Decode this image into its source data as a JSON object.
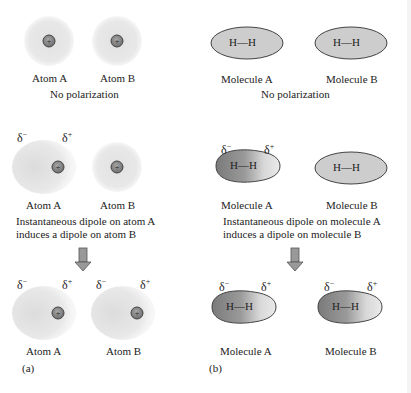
{
  "panel_a": {
    "label": "(a)",
    "row1": {
      "atom_a": "Atom A",
      "atom_b": "Atom B",
      "caption": "No polarization"
    },
    "row2": {
      "atom_a": "Atom A",
      "atom_b": "Atom B",
      "caption_line1": "Instantaneous dipole on atom A",
      "caption_line2": "induces a dipole on atom B",
      "delta_minus": "δ",
      "delta_plus": "δ",
      "minus": "−",
      "plus": "+"
    },
    "row3": {
      "atom_a": "Atom A",
      "atom_b": "Atom B"
    }
  },
  "panel_b": {
    "label": "(b)",
    "row1": {
      "mol_a": "Molecule A",
      "mol_b": "Molecule B",
      "caption": "No polarization"
    },
    "row2": {
      "mol_a": "Molecule A",
      "mol_b": "Molecule B",
      "caption_line1": "Instantaneous dipole on molecule A",
      "caption_line2": "induces a dipole on molecule B"
    },
    "row3": {
      "mol_a": "Molecule A",
      "mol_b": "Molecule B"
    },
    "bond": "H—H"
  },
  "colors": {
    "cloud": "#d8d8d8",
    "nucleus": "#8a8a8a",
    "ellipse": "#cfcfcf",
    "arrow": "#909090"
  }
}
